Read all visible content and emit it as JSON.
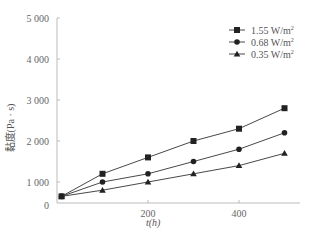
{
  "chart_data": {
    "type": "line",
    "title": "",
    "xlabel": "t(h)",
    "ylabel": "黏度(Pa · s)",
    "x": [
      10,
      100,
      200,
      300,
      400,
      500
    ],
    "x_ticks": [
      "0",
      "200",
      "400"
    ],
    "y_ticks": [
      "1 000",
      "2 000",
      "3 000",
      "4 000",
      "5 000"
    ],
    "origin_label": "0",
    "xlim": [
      0,
      560
    ],
    "ylim": [
      500,
      5000
    ],
    "grid": false,
    "legend_position": "upper right",
    "series": [
      {
        "name": "1.55 W/m²",
        "label": "1.55 W/m",
        "sup": "2",
        "marker": "square",
        "values": [
          650,
          1200,
          1600,
          2000,
          2300,
          2800
        ]
      },
      {
        "name": "0.68 W/m²",
        "label": "0.68 W/m",
        "sup": "2",
        "marker": "circle",
        "values": [
          650,
          1000,
          1200,
          1500,
          1800,
          2200
        ]
      },
      {
        "name": "0.35 W/m²",
        "label": "0.35 W/m",
        "sup": "2",
        "marker": "triangle",
        "values": [
          650,
          800,
          1000,
          1200,
          1400,
          1700
        ]
      }
    ]
  }
}
